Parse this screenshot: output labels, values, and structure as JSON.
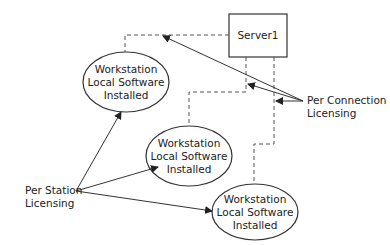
{
  "server": {
    "label": "Server1"
  },
  "workstations": [
    {
      "line1": "Workstation",
      "line2": "Local Software",
      "line3": "Installed"
    },
    {
      "line1": "Workstation",
      "line2": "Local Software",
      "line3": "Installed"
    },
    {
      "line1": "Workstation",
      "line2": "Local Software",
      "line3": "Installed"
    }
  ],
  "labels": {
    "per_connection": {
      "line1": "Per Connection",
      "line2": "Licensing"
    },
    "per_station": {
      "line1": "Per Station",
      "line2": "Licensing"
    }
  },
  "colors": {
    "stroke": "#333333",
    "dashed": "#555555",
    "text": "#222222",
    "background": "#ffffff"
  }
}
